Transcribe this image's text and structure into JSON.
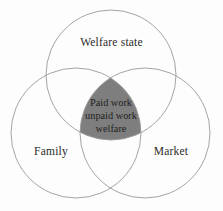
{
  "diagram": {
    "type": "venn-3-circle",
    "background_color": "#fdfdfd",
    "stroke_color": "#9a9a9a",
    "intersection_fill": "#7e7e7e",
    "text_color": "#2b2b2b",
    "circles": [
      {
        "id": "welfare-state",
        "label": "Welfare state",
        "position": "top",
        "center_x": 111,
        "center_y": 75,
        "radius": 65
      },
      {
        "id": "family",
        "label": "Family",
        "position": "bottom-left",
        "center_x": 76,
        "center_y": 133,
        "radius": 65
      },
      {
        "id": "market",
        "label": "Market",
        "position": "bottom-right",
        "center_x": 145,
        "center_y": 133,
        "radius": 65
      }
    ],
    "intersection": {
      "id": "core-intersection",
      "lines": [
        "Paid work",
        "unpaid work",
        "welfare"
      ]
    }
  }
}
